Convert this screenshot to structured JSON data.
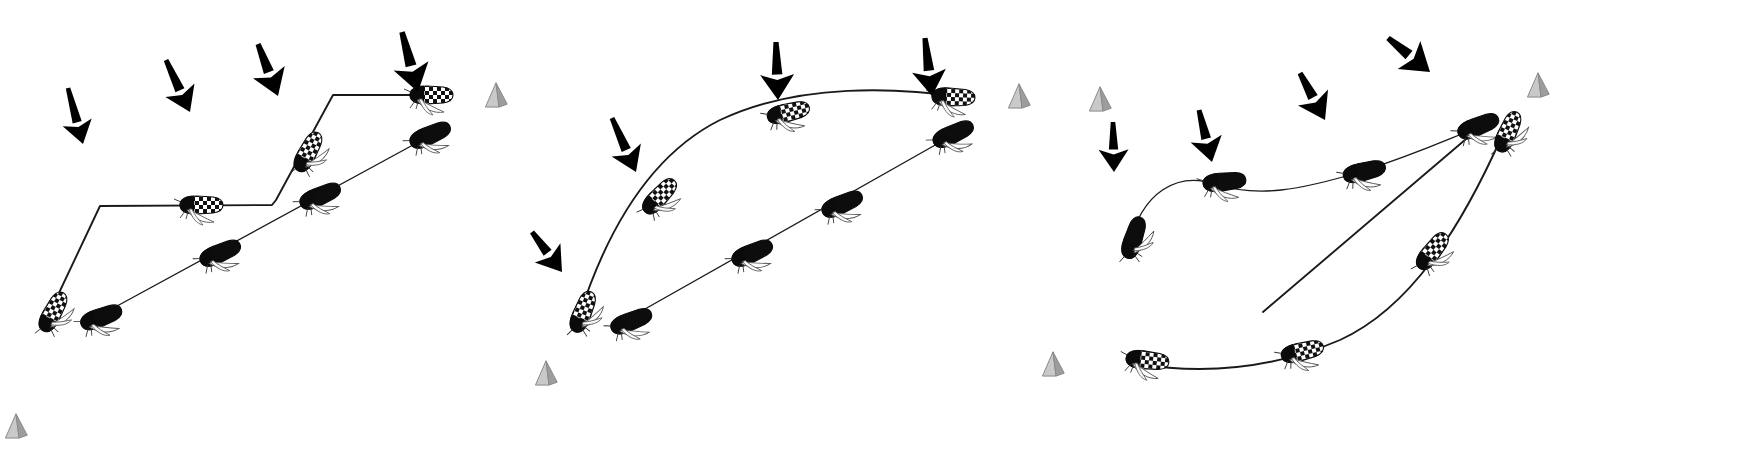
{
  "figure": {
    "background_color": "#ffffff",
    "width": 1756,
    "height": 460,
    "stroke_color": "#1a1a1a",
    "arrow_color": "#000000",
    "pyramid_fill": "#b8b8b8",
    "pyramid_stroke": "#8a8a8a",
    "checkered_light": "#ffffff",
    "checkered_dark": "#111111",
    "solid_body": "#0d0d0d",
    "wing_stroke": "#555555",
    "trajectory_thin": 1.3,
    "trajectory_thick": 1.9
  },
  "panels": [
    {
      "name": "panel-a",
      "label": "",
      "arrows": [
        {
          "name": "wind-arrow-a1",
          "x1": 68,
          "y1": 88,
          "x2": 83,
          "y2": 144,
          "width": 7.5
        },
        {
          "name": "wind-arrow-a2",
          "x1": 166,
          "y1": 60,
          "x2": 190,
          "y2": 112,
          "width": 8
        },
        {
          "name": "wind-arrow-a3",
          "x1": 258,
          "y1": 44,
          "x2": 278,
          "y2": 96,
          "width": 8.5
        },
        {
          "name": "wind-arrow-a4",
          "x1": 402,
          "y1": 32,
          "x2": 418,
          "y2": 92,
          "width": 9
        }
      ],
      "trajectories": [
        {
          "name": "trajectory-checkered-a",
          "style": "polyline",
          "insect_type": "checkered",
          "points": [
            [
              50,
              312
            ],
            [
              100,
              206
            ],
            [
              272,
              205
            ],
            [
              276,
              200
            ],
            [
              333,
              95
            ],
            [
              440,
              95
            ]
          ],
          "insects": [
            {
              "x": 52,
              "y": 314,
              "angle": -62,
              "scale": 1.0
            },
            {
              "x": 199,
              "y": 205,
              "angle": 0,
              "scale": 1.0
            },
            {
              "x": 307,
              "y": 154,
              "angle": -62,
              "scale": 1.0
            },
            {
              "x": 429,
              "y": 95,
              "angle": 0,
              "scale": 1.0
            }
          ]
        },
        {
          "name": "trajectory-solid-a",
          "style": "line",
          "insect_type": "solid",
          "points": [
            [
              95,
              318
            ],
            [
              435,
              133
            ]
          ],
          "insects": [
            {
              "x": 99,
              "y": 318,
              "angle": -21,
              "scale": 1.0
            },
            {
              "x": 218,
              "y": 254,
              "angle": -24,
              "scale": 1.0
            },
            {
              "x": 318,
              "y": 197,
              "angle": -24,
              "scale": 1.0
            },
            {
              "x": 428,
              "y": 136,
              "angle": -24,
              "scale": 1.0
            }
          ]
        }
      ],
      "pyramids": [
        {
          "name": "pyramid-marker-a1",
          "x": 496,
          "y": 99,
          "size": 17
        },
        {
          "name": "pyramid-marker-a2",
          "x": 16,
          "y": 430,
          "size": 17
        }
      ]
    },
    {
      "name": "panel-b",
      "label": "",
      "arrows": [
        {
          "name": "wind-arrow-b1",
          "x1": 612,
          "y1": 118,
          "x2": 636,
          "y2": 172,
          "width": 8
        },
        {
          "name": "wind-arrow-b2",
          "x1": 532,
          "y1": 232,
          "x2": 562,
          "y2": 272,
          "width": 8
        },
        {
          "name": "wind-arrow-b3",
          "x1": 776,
          "y1": 42,
          "x2": 778,
          "y2": 100,
          "width": 8.5
        },
        {
          "name": "wind-arrow-b4",
          "x1": 925,
          "y1": 38,
          "x2": 932,
          "y2": 96,
          "width": 8.5
        }
      ],
      "trajectories": [
        {
          "name": "trajectory-checkered-b",
          "style": "arc",
          "insect_type": "checkered",
          "path": "M 578 320 C 600 250, 640 160, 720 120 C 800 82, 900 88, 962 97",
          "insects": [
            {
              "x": 582,
              "y": 314,
              "angle": -68,
              "scale": 1.0
            },
            {
              "x": 658,
              "y": 198,
              "angle": -47,
              "scale": 1.0
            },
            {
              "x": 786,
              "y": 113,
              "angle": -14,
              "scale": 1.0
            },
            {
              "x": 951,
              "y": 97,
              "angle": 2,
              "scale": 1.0
            }
          ]
        },
        {
          "name": "trajectory-solid-b",
          "style": "line",
          "insect_type": "solid",
          "points": [
            [
              622,
              322
            ],
            [
              960,
              131
            ]
          ],
          "insects": [
            {
              "x": 629,
              "y": 322,
              "angle": -22,
              "scale": 1.0
            },
            {
              "x": 750,
              "y": 254,
              "angle": -24,
              "scale": 1.0
            },
            {
              "x": 840,
              "y": 205,
              "angle": -24,
              "scale": 1.0
            },
            {
              "x": 951,
              "y": 135,
              "angle": -25,
              "scale": 1.0
            }
          ]
        }
      ],
      "pyramids": [
        {
          "name": "pyramid-marker-b1",
          "x": 1019,
          "y": 100,
          "size": 17
        },
        {
          "name": "pyramid-marker-b2",
          "x": 546,
          "y": 377,
          "size": 17
        }
      ]
    },
    {
      "name": "panel-c",
      "label": "",
      "arrows": [
        {
          "name": "wind-arrow-c1",
          "x1": 1113,
          "y1": 122,
          "x2": 1114,
          "y2": 172,
          "width": 7.5
        },
        {
          "name": "wind-arrow-c2",
          "x1": 1199,
          "y1": 110,
          "x2": 1212,
          "y2": 162,
          "width": 8
        },
        {
          "name": "wind-arrow-c3",
          "x1": 1300,
          "y1": 73,
          "x2": 1325,
          "y2": 120,
          "width": 8.5
        },
        {
          "name": "wind-arrow-c4",
          "x1": 1388,
          "y1": 38,
          "x2": 1430,
          "y2": 72,
          "width": 9
        }
      ],
      "trajectories": [
        {
          "name": "trajectory-solid-c",
          "style": "arc",
          "insect_type": "solid",
          "path": "M 1128 248 C 1142 190, 1178 172, 1215 184 C 1258 198, 1300 190, 1360 172 C 1420 153, 1450 138, 1482 126",
          "insects": [
            {
              "x": 1133,
              "y": 240,
              "angle": -72,
              "scale": 1.0
            },
            {
              "x": 1222,
              "y": 182,
              "angle": -6,
              "scale": 1.0
            },
            {
              "x": 1362,
              "y": 172,
              "angle": -14,
              "scale": 1.0
            },
            {
              "x": 1476,
              "y": 127,
              "angle": -22,
              "scale": 1.0
            }
          ]
        },
        {
          "name": "trajectory-checkered-c",
          "style": "arc",
          "insect_type": "checkered",
          "path": "M 1138 364 C 1200 374, 1270 370, 1340 340 C 1410 308, 1460 230, 1502 136",
          "insects": [
            {
              "x": 1145,
              "y": 360,
              "angle": 6,
              "scale": 1.0
            },
            {
              "x": 1300,
              "y": 352,
              "angle": -14,
              "scale": 1.0
            },
            {
              "x": 1431,
              "y": 253,
              "angle": -52,
              "scale": 1.0
            },
            {
              "x": 1507,
              "y": 134,
              "angle": -66,
              "scale": 1.0
            }
          ]
        },
        {
          "name": "trajectory-straight-c",
          "style": "line",
          "insect_type": "none",
          "points": [
            [
              1263,
              312
            ],
            [
              1486,
              122
            ]
          ],
          "insects": []
        }
      ],
      "pyramids": [
        {
          "name": "pyramid-marker-c1",
          "x": 1100,
          "y": 103,
          "size": 17
        },
        {
          "name": "pyramid-marker-c2",
          "x": 1538,
          "y": 89,
          "size": 17
        },
        {
          "name": "pyramid-marker-c3",
          "x": 1053,
          "y": 368,
          "size": 17
        }
      ]
    }
  ],
  "legend": {
    "insect_checkered_name": "checkered-insect-icon",
    "insect_solid_name": "solid-insect-icon",
    "arrow_name": "wind-arrow-icon",
    "pyramid_name": "pyramid-marker-icon"
  },
  "chart_data": {
    "type": "scatter",
    "xlabel": "",
    "ylabel": "",
    "series": [
      {
        "name": "Panel A - checkered path",
        "x": [
          50,
          100,
          272,
          333,
          440
        ],
        "y": [
          312,
          206,
          205,
          95,
          95
        ]
      },
      {
        "name": "Panel A - solid path",
        "x": [
          95,
          435
        ],
        "y": [
          318,
          133
        ]
      },
      {
        "name": "Panel B - checkered arc",
        "x": [
          578,
          658,
          786,
          962
        ],
        "y": [
          320,
          198,
          113,
          97
        ]
      },
      {
        "name": "Panel B - solid path",
        "x": [
          622,
          960
        ],
        "y": [
          322,
          131
        ]
      },
      {
        "name": "Panel C - solid arc",
        "x": [
          1128,
          1222,
          1362,
          1482
        ],
        "y": [
          248,
          182,
          172,
          126
        ]
      },
      {
        "name": "Panel C - checkered arc",
        "x": [
          1138,
          1300,
          1431,
          1502
        ],
        "y": [
          364,
          352,
          253,
          136
        ]
      },
      {
        "name": "Panel C - straight line",
        "x": [
          1263,
          1486
        ],
        "y": [
          312,
          122
        ]
      }
    ],
    "annotations": [
      "downward wind arrows",
      "gray pyramid landmarks"
    ],
    "legend_position": "none",
    "grid": false
  }
}
